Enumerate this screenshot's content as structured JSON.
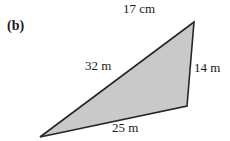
{
  "figure": {
    "part_label": "(b)",
    "shape": "triangle",
    "fill_color": "#c9c9c9",
    "stroke_color": "#262626",
    "background_color": "#ffffff",
    "vertices": {
      "apex_top_right": [
        194,
        22
      ],
      "bottom_right": [
        187,
        106
      ],
      "bottom_left": [
        40,
        137
      ]
    },
    "labels": {
      "top": "17 cm",
      "left": "32 m",
      "right": "14 m",
      "bottom": "25 m"
    },
    "measurements": [
      {
        "side": "top",
        "value": 17,
        "unit": "cm",
        "text": "17 cm"
      },
      {
        "side": "left",
        "value": 32,
        "unit": "m",
        "text": "32 m"
      },
      {
        "side": "right",
        "value": 14,
        "unit": "m",
        "text": "14 m"
      },
      {
        "side": "bottom",
        "value": 25,
        "unit": "m",
        "text": "25 m"
      }
    ]
  }
}
